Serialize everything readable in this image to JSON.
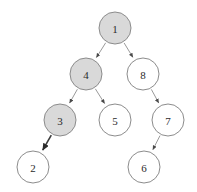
{
  "diagram": {
    "type": "tree",
    "background_color": "#ffffff",
    "node_fill_highlighted": "#d9d9d9",
    "node_fill_default": "#ffffff",
    "node_stroke_color": "#8c8c8c",
    "edge_color": "#9a9a9a",
    "edge_color_highlighted": "#3c3c3c",
    "label_color": "#2b2b2b",
    "nodes": [
      {
        "id": "n1",
        "label": "1",
        "cx": 115,
        "cy": 28,
        "r": 16,
        "state": "highlighted"
      },
      {
        "id": "n4",
        "label": "4",
        "cx": 86,
        "cy": 74,
        "r": 16,
        "state": "highlighted"
      },
      {
        "id": "n8",
        "label": "8",
        "cx": 143,
        "cy": 74,
        "r": 16,
        "state": "default"
      },
      {
        "id": "n3",
        "label": "3",
        "cx": 60,
        "cy": 120,
        "r": 16,
        "state": "highlighted"
      },
      {
        "id": "n5",
        "label": "5",
        "cx": 115,
        "cy": 120,
        "r": 16,
        "state": "default"
      },
      {
        "id": "n7",
        "label": "7",
        "cx": 168,
        "cy": 120,
        "r": 16,
        "state": "default"
      },
      {
        "id": "n2",
        "label": "2",
        "cx": 33,
        "cy": 167,
        "r": 16,
        "state": "default"
      },
      {
        "id": "n6",
        "label": "6",
        "cx": 144,
        "cy": 167,
        "r": 16,
        "state": "default"
      }
    ],
    "edges": [
      {
        "id": "e1-4",
        "from": "n1",
        "to": "n4",
        "style": "normal",
        "arrow": true
      },
      {
        "id": "e1-8",
        "from": "n1",
        "to": "n8",
        "style": "normal",
        "arrow": true
      },
      {
        "id": "e4-3",
        "from": "n4",
        "to": "n3",
        "style": "normal",
        "arrow": true
      },
      {
        "id": "e4-5",
        "from": "n4",
        "to": "n5",
        "style": "normal",
        "arrow": true
      },
      {
        "id": "e3-2",
        "from": "n3",
        "to": "n2",
        "style": "highlighted",
        "arrow": true
      },
      {
        "id": "e8-7",
        "from": "n8",
        "to": "n7",
        "style": "normal",
        "arrow": true
      },
      {
        "id": "e7-6",
        "from": "n7",
        "to": "n6",
        "style": "normal",
        "arrow": true
      }
    ]
  }
}
